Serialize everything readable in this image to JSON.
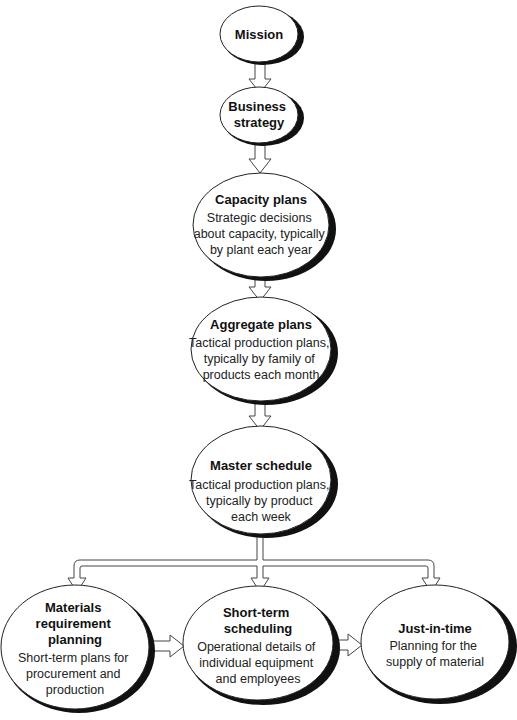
{
  "diagram": {
    "type": "flowchart",
    "colors": {
      "background": "#ffffff",
      "stroke": "#222222",
      "shadow": "#111111"
    },
    "nodes": [
      {
        "id": "mission",
        "title_lines": [
          "Mission"
        ],
        "desc_lines": []
      },
      {
        "id": "business_strategy",
        "title_lines": [
          "Business",
          "strategy"
        ],
        "desc_lines": []
      },
      {
        "id": "capacity_plans",
        "title_lines": [
          "Capacity plans"
        ],
        "desc_lines": [
          "Strategic decisions",
          "about capacity, typically",
          "by plant each year"
        ]
      },
      {
        "id": "aggregate_plans",
        "title_lines": [
          "Aggregate plans"
        ],
        "desc_lines": [
          "Tactical production plans,",
          "typically by family of",
          "products each month"
        ]
      },
      {
        "id": "master_schedule",
        "title_lines": [
          "Master schedule"
        ],
        "desc_lines": [
          "Tactical production plans,",
          "typically by product",
          "each week"
        ]
      },
      {
        "id": "mrp",
        "title_lines": [
          "Materials",
          "requirement",
          "planning"
        ],
        "desc_lines": [
          "Short-term plans for",
          "procurement and",
          "production"
        ]
      },
      {
        "id": "short_term_scheduling",
        "title_lines": [
          "Short-term",
          "scheduling"
        ],
        "desc_lines": [
          "Operational details of",
          "individual equipment",
          "and employees"
        ]
      },
      {
        "id": "just_in_time",
        "title_lines": [
          "Just-in-time"
        ],
        "desc_lines": [
          "Planning for the",
          "supply of material"
        ]
      }
    ],
    "edges": [
      {
        "from": "mission",
        "to": "business_strategy"
      },
      {
        "from": "business_strategy",
        "to": "capacity_plans"
      },
      {
        "from": "capacity_plans",
        "to": "aggregate_plans"
      },
      {
        "from": "aggregate_plans",
        "to": "master_schedule"
      },
      {
        "from": "master_schedule",
        "to": "mrp"
      },
      {
        "from": "master_schedule",
        "to": "short_term_scheduling"
      },
      {
        "from": "master_schedule",
        "to": "just_in_time"
      },
      {
        "from": "mrp",
        "to": "short_term_scheduling"
      },
      {
        "from": "short_term_scheduling",
        "to": "just_in_time"
      }
    ]
  }
}
